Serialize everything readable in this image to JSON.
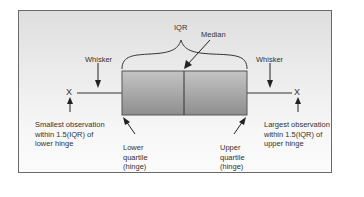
{
  "diagram": {
    "type": "boxplot-anatomy",
    "labels": {
      "iqr": "IQR",
      "median": "Median",
      "whisker_left": "Whisker",
      "whisker_right": "Whisker",
      "outlier_left": "X",
      "outlier_right": "X",
      "smallest_line1": "Smallest observation",
      "smallest_line2": "within 1.5(IQR) of",
      "smallest_line3": "lower hinge",
      "largest_line1": "Largest observation",
      "largest_line2": "within 1.5(IQR) of",
      "largest_line3": "upper hinge",
      "lower_q_line1": "Lower",
      "lower_q_line2": "quartile",
      "lower_q_line3": "(hinge)",
      "upper_q_line1": "Upper",
      "upper_q_line2": "quartile",
      "upper_q_line3": "(hinge)"
    },
    "colors": {
      "box_top": "#bdbdbd",
      "box_bottom": "#8f8f8f",
      "stroke": "#333333",
      "frame_border": "#6a6a6a"
    }
  }
}
